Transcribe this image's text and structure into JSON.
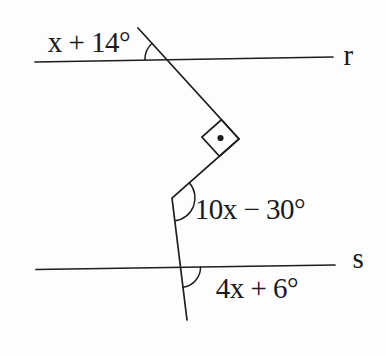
{
  "figure": {
    "colors": {
      "background": "#fdfdfd",
      "ink": "#1e1e1e"
    },
    "line_labels": {
      "r": "r",
      "s": "s"
    },
    "angle_labels": {
      "top": "x + 14°",
      "middle": "10x − 30°",
      "bottom": "4x + 6°"
    }
  }
}
